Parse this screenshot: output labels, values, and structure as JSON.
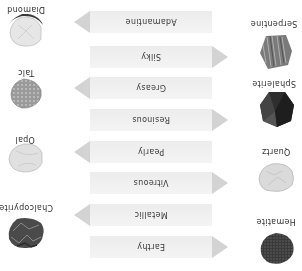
{
  "diagram": {
    "title": "",
    "orientation": "rotated 180 degrees",
    "luster_types": [
      {
        "label": "Earthy",
        "points_to": "Hematite",
        "side": "left"
      },
      {
        "label": "Metallic",
        "points_to": "Chalcopyrite",
        "side": "right"
      },
      {
        "label": "Vitreous",
        "points_to": "Quartz",
        "side": "left"
      },
      {
        "label": "Pearly",
        "points_to": "Opal",
        "side": "right"
      },
      {
        "label": "Resinous",
        "points_to": "Sphalerite",
        "side": "left"
      },
      {
        "label": "Greasy",
        "points_to": "Talc",
        "side": "right"
      },
      {
        "label": "Silky",
        "points_to": "Serpentine",
        "side": "left"
      },
      {
        "label": "Adamantine",
        "points_to": "Diamond",
        "side": "right"
      }
    ],
    "left_minerals": [
      {
        "name": "Hematite",
        "color": "#3a3a3a"
      },
      {
        "name": "Quartz",
        "color": "#d6d6d6"
      },
      {
        "name": "Sphalerite",
        "color": "#2c2c2c"
      },
      {
        "name": "Serpentine",
        "color": "#7a7a7a"
      }
    ],
    "right_minerals": [
      {
        "name": "Chalcopyrite",
        "color": "#4a4a4a"
      },
      {
        "name": "Opal",
        "color": "#dcdcdc"
      },
      {
        "name": "Talc",
        "color": "#9a9a9a"
      },
      {
        "name": "Diamond",
        "color": "#e2e2e2"
      }
    ],
    "colors": {
      "band": "#f0f0f0",
      "arrow": "#d3d3d3",
      "text": "#333333"
    }
  }
}
